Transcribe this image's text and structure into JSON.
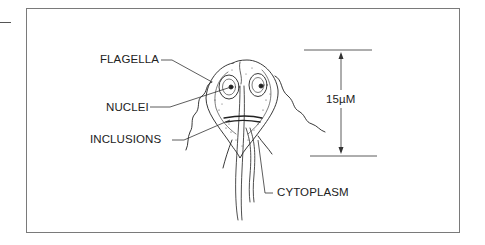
{
  "diagram": {
    "labels": {
      "flagella": "FLAGELLA",
      "nuclei": "NUCLEI",
      "inclusions": "INCLUSIONS",
      "cytoplasm": "CYTOPLASM"
    },
    "scale_bar": {
      "label": "15µM"
    }
  }
}
